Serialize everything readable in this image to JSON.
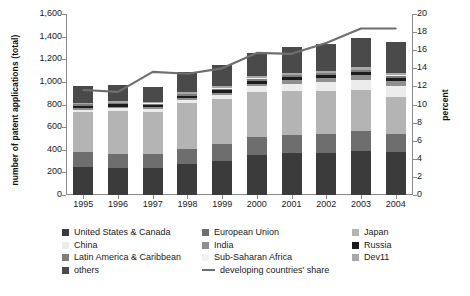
{
  "chart_data": {
    "type": "bar",
    "title": "",
    "subtitle": "",
    "xlabel": "",
    "ylabel": "number of patent applications (total)",
    "ylabel_secondary": "percent",
    "categories": [
      "1995",
      "1996",
      "1997",
      "1998",
      "1999",
      "2000",
      "2001",
      "2002",
      "2003",
      "2004"
    ],
    "ylim": [
      0,
      1600
    ],
    "yticks": [
      "0",
      "200",
      "400",
      "600",
      "800",
      "1,000",
      "1,200",
      "1,400",
      "1,600"
    ],
    "ylim_secondary": [
      0,
      20
    ],
    "yticks_secondary": [
      "0",
      "2",
      "4",
      "6",
      "8",
      "10",
      "12",
      "14",
      "16",
      "18",
      "20"
    ],
    "grid": false,
    "legend_position": "bottom",
    "stacked": true,
    "series": [
      {
        "name": "United States & Canada",
        "color": "#3b3b3b",
        "values": [
          252,
          241,
          237,
          270,
          305,
          355,
          368,
          370,
          392,
          378
        ]
      },
      {
        "name": "European Union",
        "color": "#6e6e6e",
        "values": [
          125,
          120,
          130,
          140,
          150,
          160,
          165,
          168,
          170,
          165
        ]
      },
      {
        "name": "Japan",
        "color": "#b4b4b4",
        "values": [
          360,
          385,
          370,
          400,
          395,
          395,
          390,
          385,
          368,
          322
        ]
      },
      {
        "name": "China",
        "color": "#ececec",
        "values": [
          18,
          20,
          22,
          28,
          35,
          50,
          62,
          75,
          90,
          100
        ]
      },
      {
        "name": "India",
        "color": "#8f8f8f",
        "values": [
          14,
          15,
          16,
          18,
          20,
          26,
          30,
          34,
          38,
          42
        ]
      },
      {
        "name": "Russia",
        "color": "#1c1c1c",
        "values": [
          22,
          22,
          20,
          22,
          24,
          26,
          26,
          26,
          26,
          26
        ]
      },
      {
        "name": "Latin America & Caribbean",
        "color": "#7d7d7d",
        "values": [
          10,
          10,
          11,
          12,
          13,
          15,
          16,
          17,
          18,
          19
        ]
      },
      {
        "name": "Sub-Saharan Africa",
        "color": "#f2f2f2",
        "values": [
          5,
          5,
          5,
          5,
          6,
          6,
          6,
          7,
          7,
          7
        ]
      },
      {
        "name": "Dev11",
        "color": "#a8a8a8",
        "values": [
          12,
          12,
          13,
          14,
          15,
          17,
          18,
          19,
          20,
          21
        ]
      },
      {
        "name": "others",
        "color": "#4a4a4a",
        "values": [
          142,
          142,
          128,
          181,
          190,
          210,
          224,
          234,
          260,
          270
        ]
      }
    ],
    "line_series": {
      "name": "developing countries' share",
      "color": "#6f6f6f",
      "axis": "secondary",
      "values": [
        11.6,
        11.4,
        13.6,
        13.4,
        14.0,
        15.7,
        15.6,
        16.8,
        18.4,
        18.4
      ]
    }
  },
  "legend": {
    "rows": [
      [
        {
          "label": "United States & Canada",
          "swatch": "#3b3b3b",
          "kind": "box"
        },
        {
          "label": "European Union",
          "swatch": "#6e6e6e",
          "kind": "box"
        },
        {
          "label": "Japan",
          "swatch": "#b4b4b4",
          "kind": "box"
        }
      ],
      [
        {
          "label": "China",
          "swatch": "#ececec",
          "kind": "box"
        },
        {
          "label": "India",
          "swatch": "#8f8f8f",
          "kind": "box"
        },
        {
          "label": "Russia",
          "swatch": "#1c1c1c",
          "kind": "box"
        }
      ],
      [
        {
          "label": "Latin America & Caribbean",
          "swatch": "#7d7d7d",
          "kind": "box"
        },
        {
          "label": "Sub-Saharan Africa",
          "swatch": "#f2f2f2",
          "kind": "box"
        },
        {
          "label": "Dev11",
          "swatch": "#a8a8a8",
          "kind": "box"
        }
      ],
      [
        {
          "label": "others",
          "swatch": "#4a4a4a",
          "kind": "box"
        },
        {
          "label": "developing countries' share",
          "swatch": "#6f6f6f",
          "kind": "line"
        }
      ]
    ]
  },
  "axes": {
    "left_title": "number of patent applications (total)",
    "right_title": "percent"
  }
}
